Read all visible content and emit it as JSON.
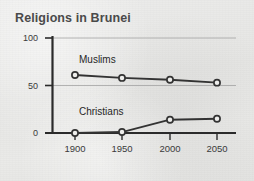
{
  "chart_data": {
    "type": "line",
    "title": "Religions in Brunei",
    "xlabel": "",
    "ylabel": "",
    "x": [
      1900,
      1950,
      2000,
      2050
    ],
    "xtick_labels": [
      "1900",
      "1950",
      "2000",
      "2050"
    ],
    "ytick_labels": [
      "0",
      "50",
      "100"
    ],
    "yticks": [
      0,
      50,
      100
    ],
    "ylim": [
      0,
      100
    ],
    "xlim": [
      1900,
      2050
    ],
    "grid": true,
    "legend_position": "inline-labels",
    "series": [
      {
        "name": "Muslims",
        "values": [
          61,
          58,
          56,
          53
        ],
        "color": "#333333",
        "marker": "open-circle"
      },
      {
        "name": "Christians",
        "values": [
          0,
          1,
          14,
          15
        ],
        "color": "#333333",
        "marker": "open-circle"
      }
    ]
  },
  "colors": {
    "line": "#333333",
    "axis": "#2b2b2b",
    "grid": "#9a9a9a",
    "title": "#4a4a4a",
    "background": "#e8e8e6"
  }
}
